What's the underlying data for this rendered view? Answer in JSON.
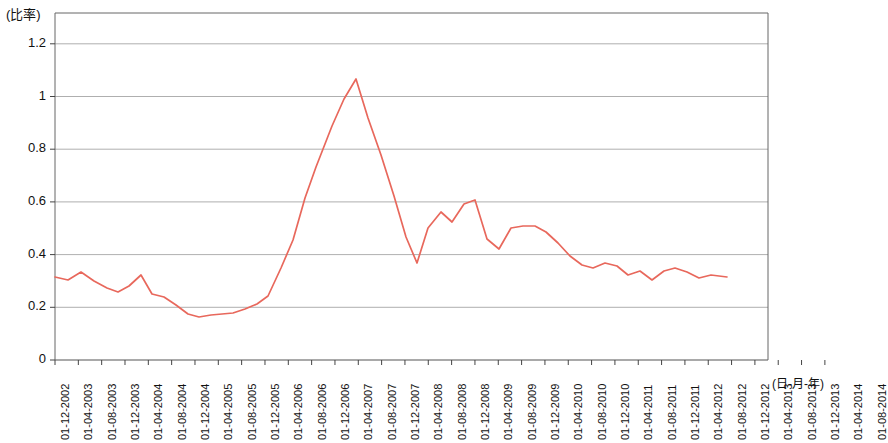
{
  "chart_data": {
    "type": "line",
    "title": "",
    "subtitle": "",
    "xlabel": "(日-月-年)",
    "ylabel": "(比率)",
    "ylim": [
      0,
      1.3
    ],
    "yticks": [
      "0",
      "0.2",
      "0.4",
      "0.6",
      "0.8",
      "1",
      "1.2"
    ],
    "ytick_values": [
      0,
      0.2,
      0.4,
      0.6,
      0.8,
      1,
      1.2
    ],
    "grid": "horizontal",
    "legend": "none",
    "line_color": "#e8685c",
    "categories": [
      "01-12-2002",
      "01-04-2003",
      "01-08-2003",
      "01-12-2003",
      "01-04-2004",
      "01-08-2004",
      "01-12-2004",
      "01-04-2005",
      "01-08-2005",
      "01-12-2005",
      "01-04-2006",
      "01-08-2006",
      "01-12-2006",
      "01-04-2007",
      "01-08-2007",
      "01-12-2007",
      "01-04-2008",
      "01-08-2008",
      "01-12-2008",
      "01-04-2009",
      "01-08-2009",
      "01-12-2009",
      "01-04-2010",
      "01-08-2010",
      "01-12-2010",
      "01-04-2011",
      "01-08-2011",
      "01-12-2011",
      "01-04-2012",
      "01-08-2012",
      "01-12-2012",
      "01-04-2013",
      "01-08-2013",
      "01-12-2013",
      "01-04-2014",
      "01-08-2014"
    ],
    "series": [
      {
        "name": "比率",
        "values": [
          0.31,
          0.3,
          0.32,
          0.3,
          0.27,
          0.26,
          0.28,
          0.31,
          0.24,
          0.23,
          0.2,
          0.17,
          0.17,
          0.17,
          0.16,
          0.17,
          0.21,
          0.22,
          0.33,
          0.47,
          0.6,
          0.77,
          1.07,
          0.75,
          0.6,
          0.47,
          0.38,
          0.5,
          0.56,
          0.52,
          0.58,
          0.59,
          0.48,
          0.41,
          0.49,
          0.49
        ]
      }
    ],
    "points_x_pixels": [
      55,
      68,
      81,
      94,
      107,
      118,
      129,
      141,
      152,
      164,
      176,
      188,
      199,
      211,
      222,
      233,
      245,
      257,
      268,
      281,
      293,
      316,
      356,
      381,
      394,
      406,
      417,
      428,
      441,
      452,
      464,
      475,
      487,
      499,
      511,
      523,
      535,
      546,
      558,
      570,
      582,
      593,
      605,
      617,
      628,
      640,
      652,
      664,
      675,
      687,
      699,
      711,
      727
    ],
    "series_pixel_path": [
      [
        55,
        277
      ],
      [
        68,
        280
      ],
      [
        81,
        272
      ],
      [
        94,
        281
      ],
      [
        107,
        288
      ],
      [
        118,
        292
      ],
      [
        129,
        286
      ],
      [
        141,
        275
      ],
      [
        152,
        294
      ],
      [
        164,
        297
      ],
      [
        176,
        305
      ],
      [
        188,
        314
      ],
      [
        199,
        317
      ],
      [
        211,
        315
      ],
      [
        222,
        314
      ],
      [
        233,
        313
      ],
      [
        245,
        309
      ],
      [
        257,
        304
      ],
      [
        268,
        296
      ],
      [
        281,
        268
      ],
      [
        293,
        240
      ],
      [
        305,
        198
      ],
      [
        316,
        167
      ],
      [
        332,
        126
      ],
      [
        344,
        99
      ],
      [
        356,
        79
      ],
      [
        368,
        118
      ],
      [
        381,
        155
      ],
      [
        394,
        196
      ],
      [
        406,
        237
      ],
      [
        417,
        263
      ],
      [
        428,
        228
      ],
      [
        441,
        212
      ],
      [
        452,
        222
      ],
      [
        464,
        204
      ],
      [
        475,
        200
      ],
      [
        487,
        239
      ],
      [
        499,
        249
      ],
      [
        511,
        228
      ],
      [
        523,
        226
      ],
      [
        535,
        226
      ],
      [
        546,
        232
      ],
      [
        558,
        243
      ],
      [
        570,
        256
      ],
      [
        582,
        265
      ],
      [
        593,
        268
      ],
      [
        605,
        263
      ],
      [
        617,
        266
      ],
      [
        628,
        275
      ],
      [
        640,
        271
      ],
      [
        652,
        280
      ],
      [
        664,
        271
      ],
      [
        675,
        268
      ],
      [
        687,
        272
      ],
      [
        699,
        278
      ],
      [
        711,
        275
      ],
      [
        727,
        277
      ]
    ]
  },
  "axes": {
    "plot_left_px": 55,
    "plot_right_px": 768,
    "plot_top_px": 13,
    "plot_bottom_px": 360,
    "y_zero_px": 360,
    "y_per_unit_px": 263.5,
    "x_first_tick_px": 55,
    "x_tick_step_px": 23.33
  }
}
